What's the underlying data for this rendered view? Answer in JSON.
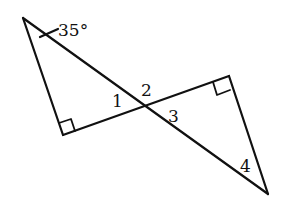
{
  "diagram": {
    "points": {
      "A": [
        23,
        18
      ],
      "B": [
        63,
        135
      ],
      "O": [
        146,
        107
      ],
      "C": [
        229,
        76
      ],
      "D": [
        268,
        194
      ]
    },
    "segments": [
      [
        "A",
        "B"
      ],
      [
        "B",
        "C"
      ],
      [
        "A",
        "D"
      ],
      [
        "C",
        "D"
      ]
    ],
    "right_angles": [
      "B",
      "C"
    ],
    "labels": {
      "angle_given": "35°",
      "angle1": "1",
      "angle2": "2",
      "angle3": "3",
      "angle4": "4"
    },
    "colors": {
      "stroke": "#111111",
      "background": "#ffffff"
    }
  }
}
